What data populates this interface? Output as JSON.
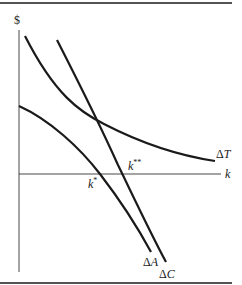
{
  "diagram": {
    "y_axis_label": "$",
    "x_axis_label": "k",
    "curves": [
      {
        "name": "delta-T",
        "label": "ΔT",
        "label_sym": "Δ",
        "label_var": "T",
        "shape": "convex decreasing"
      },
      {
        "name": "delta-C",
        "label": "ΔC",
        "label_sym": "Δ",
        "label_var": "C",
        "shape": "steep decreasing"
      },
      {
        "name": "delta-A",
        "label": "ΔA",
        "label_sym": "Δ",
        "label_var": "A",
        "shape": "concave decreasing"
      }
    ],
    "points": [
      {
        "name": "k-star",
        "label_var": "k",
        "label_sup": "*",
        "description": "ΔA crosses k-axis"
      },
      {
        "name": "k-double-star",
        "label_var": "k",
        "label_sup": "**",
        "description": "ΔC crosses k-axis"
      }
    ],
    "colors": {
      "line": "#1a1a1a",
      "background": "#ffffff"
    }
  }
}
